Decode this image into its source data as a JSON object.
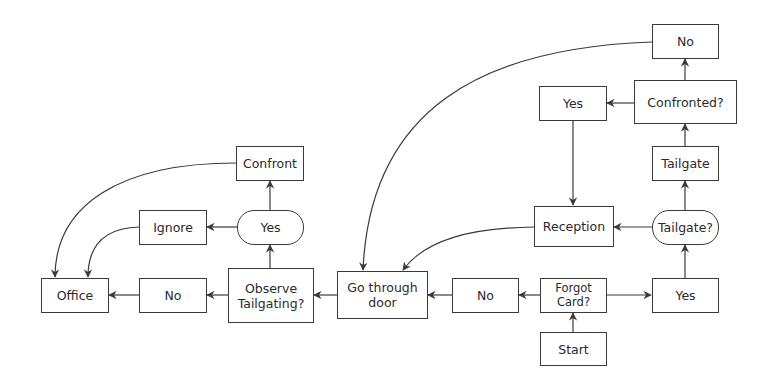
{
  "diagram": {
    "type": "flowchart",
    "colors": {
      "stroke": "#3a3a3a",
      "text": "#2a2a2a",
      "background": "#ffffff"
    },
    "nodes": {
      "start": {
        "label": "Start",
        "shape": "rect"
      },
      "forgot_card": {
        "label": "Forgot\nCard?",
        "shape": "rect"
      },
      "no_forgot": {
        "label": "No",
        "shape": "rect"
      },
      "yes_forgot": {
        "label": "Yes",
        "shape": "rect"
      },
      "tailgate_q": {
        "label": "Tailgate?",
        "shape": "pill"
      },
      "tailgate": {
        "label": "Tailgate",
        "shape": "rect"
      },
      "confronted_q": {
        "label": "Confronted?",
        "shape": "rect"
      },
      "no_confronted": {
        "label": "No",
        "shape": "rect"
      },
      "yes_confronted": {
        "label": "Yes",
        "shape": "rect"
      },
      "reception": {
        "label": "Reception",
        "shape": "rect"
      },
      "go_through_door": {
        "label": "Go through\ndoor",
        "shape": "rect"
      },
      "observe_tailgating": {
        "label": "Observe\nTailgating?",
        "shape": "rect"
      },
      "no_observe": {
        "label": "No",
        "shape": "rect"
      },
      "yes_observe": {
        "label": "Yes",
        "shape": "pill"
      },
      "confront": {
        "label": "Confront",
        "shape": "rect"
      },
      "ignore": {
        "label": "Ignore",
        "shape": "rect"
      },
      "office": {
        "label": "Office",
        "shape": "rect"
      }
    },
    "edges": [
      {
        "from": "start",
        "to": "forgot_card"
      },
      {
        "from": "forgot_card",
        "to": "no_forgot"
      },
      {
        "from": "forgot_card",
        "to": "yes_forgot"
      },
      {
        "from": "yes_forgot",
        "to": "tailgate_q"
      },
      {
        "from": "tailgate_q",
        "to": "tailgate"
      },
      {
        "from": "tailgate_q",
        "to": "reception"
      },
      {
        "from": "tailgate",
        "to": "confronted_q"
      },
      {
        "from": "confronted_q",
        "to": "no_confronted"
      },
      {
        "from": "confronted_q",
        "to": "yes_confronted"
      },
      {
        "from": "yes_confronted",
        "to": "reception"
      },
      {
        "from": "no_confronted",
        "to": "go_through_door"
      },
      {
        "from": "reception",
        "to": "go_through_door"
      },
      {
        "from": "no_forgot",
        "to": "go_through_door"
      },
      {
        "from": "go_through_door",
        "to": "observe_tailgating"
      },
      {
        "from": "observe_tailgating",
        "to": "no_observe"
      },
      {
        "from": "observe_tailgating",
        "to": "yes_observe"
      },
      {
        "from": "yes_observe",
        "to": "confront"
      },
      {
        "from": "yes_observe",
        "to": "ignore"
      },
      {
        "from": "no_observe",
        "to": "office"
      },
      {
        "from": "confront",
        "to": "office"
      },
      {
        "from": "ignore",
        "to": "office"
      }
    ]
  }
}
